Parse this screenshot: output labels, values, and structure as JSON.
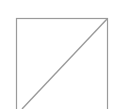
{
  "graphic": {
    "type": "placeholder-box",
    "icon": "square-with-diagonal-icon",
    "stroke_color": "#9a9a9a",
    "background": "#ffffff",
    "box": {
      "x": 16.5,
      "y": 18.5,
      "width": 91,
      "height": 100
    },
    "diagonal": {
      "x1": 22,
      "y1": 109,
      "x2": 107.5,
      "y2": 18.5
    }
  }
}
